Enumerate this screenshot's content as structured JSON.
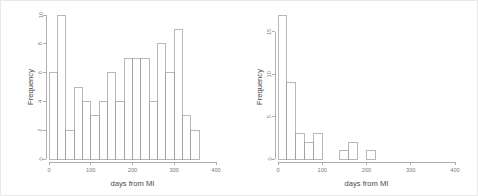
{
  "figure": {
    "width": 478,
    "height": 196,
    "background": "#ffffff",
    "border_color": "#e9e9e9",
    "axis_color": "#8d8d8d",
    "bar_stroke": "#9a9a9a",
    "label_color": "#4a4a4a",
    "tick_label_color": "#7a7a7a"
  },
  "chart_data": [
    {
      "type": "bar",
      "id": "left-histogram",
      "title": "",
      "subtitle": "",
      "xlabel": "days from MI",
      "ylabel": "Frequency",
      "xlim": [
        0,
        400
      ],
      "ylim": [
        0,
        10
      ],
      "xticks": [
        0,
        100,
        200,
        300,
        400
      ],
      "xtick_labels": [
        "0",
        "100",
        "200",
        "300",
        "400"
      ],
      "yticks": [
        0,
        2,
        4,
        6,
        8,
        10
      ],
      "ytick_labels": [
        "0",
        "2",
        "4",
        "6",
        "8",
        "10"
      ],
      "grid": false,
      "legend": false,
      "legend_position": "none",
      "bin_width": 20,
      "bin_edges": [
        0,
        20,
        40,
        60,
        80,
        100,
        120,
        140,
        160,
        180,
        200,
        220,
        240,
        260,
        280,
        300,
        320,
        340,
        360
      ],
      "categories": [
        "0-20",
        "20-40",
        "40-60",
        "60-80",
        "80-100",
        "100-120",
        "120-140",
        "140-160",
        "160-180",
        "180-200",
        "200-220",
        "220-240",
        "240-260",
        "260-280",
        "280-300",
        "300-320",
        "320-340",
        "340-360"
      ],
      "values": [
        6,
        10,
        2,
        5,
        4,
        3,
        4,
        6,
        4,
        7,
        7,
        7,
        4,
        8,
        6,
        9,
        3,
        2,
        9
      ]
    },
    {
      "type": "bar",
      "id": "right-histogram",
      "title": "",
      "subtitle": "",
      "xlabel": "days from MI",
      "ylabel": "Frequency",
      "xlim": [
        0,
        400
      ],
      "ylim": [
        0,
        17
      ],
      "xticks": [
        0,
        100,
        200,
        300,
        400
      ],
      "xtick_labels": [
        "0",
        "100",
        "200",
        "300",
        "400"
      ],
      "yticks": [
        0,
        5,
        10,
        15
      ],
      "ytick_labels": [
        "0",
        "5",
        "10",
        "15"
      ],
      "grid": false,
      "legend": false,
      "legend_position": "none",
      "bin_width": 20,
      "bin_edges": [
        0,
        20,
        40,
        60,
        80,
        100,
        120,
        140,
        160,
        180,
        200,
        220
      ],
      "categories": [
        "0-20",
        "20-40",
        "40-60",
        "60-80",
        "80-100",
        "100-120",
        "120-140",
        "140-160",
        "160-180",
        "180-200",
        "200-220"
      ],
      "values": [
        17,
        9,
        3,
        2,
        3,
        0,
        0,
        1,
        2,
        0,
        1
      ]
    }
  ]
}
